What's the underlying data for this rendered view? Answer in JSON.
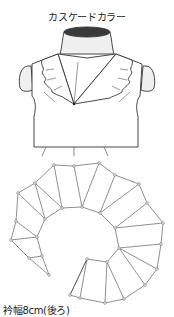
{
  "figure": {
    "title": "カスケードカラー",
    "caption": "衿幅8cm(後ろ)"
  },
  "colors": {
    "line": "#333333",
    "neck_cap": "#3a3a3a",
    "form_fill": "#f0f0f0",
    "point_fill": "#ffffff"
  },
  "pattern": {
    "outer_edge": [
      [
        11,
        240
      ],
      [
        16,
        221
      ],
      [
        18,
        193
      ],
      [
        35,
        183
      ],
      [
        54,
        165
      ],
      [
        74,
        166
      ],
      [
        99,
        163
      ],
      [
        115,
        175
      ],
      [
        139,
        184
      ],
      [
        147,
        203
      ],
      [
        163,
        223
      ],
      [
        161,
        244
      ],
      [
        157,
        269
      ],
      [
        145,
        285
      ],
      [
        124,
        299
      ],
      [
        105,
        303
      ],
      [
        80,
        298
      ],
      [
        70,
        295
      ]
    ],
    "inner_edge": [
      [
        49,
        275
      ],
      [
        42,
        256
      ],
      [
        37,
        237
      ],
      [
        45,
        219
      ],
      [
        62,
        208
      ],
      [
        82,
        207
      ],
      [
        100,
        213
      ],
      [
        115,
        228
      ],
      [
        119,
        248
      ],
      [
        107,
        262
      ],
      [
        87,
        259
      ]
    ],
    "spokes": [
      [
        [
          11,
          240
        ],
        [
          37,
          237
        ]
      ],
      [
        [
          16,
          221
        ],
        [
          37,
          237
        ]
      ],
      [
        [
          18,
          193
        ],
        [
          45,
          219
        ]
      ],
      [
        [
          35,
          183
        ],
        [
          45,
          219
        ]
      ],
      [
        [
          35,
          183
        ],
        [
          62,
          208
        ]
      ],
      [
        [
          54,
          165
        ],
        [
          62,
          208
        ]
      ],
      [
        [
          74,
          166
        ],
        [
          82,
          207
        ]
      ],
      [
        [
          99,
          163
        ],
        [
          82,
          207
        ]
      ],
      [
        [
          115,
          175
        ],
        [
          100,
          213
        ]
      ],
      [
        [
          139,
          184
        ],
        [
          100,
          213
        ]
      ],
      [
        [
          147,
          203
        ],
        [
          115,
          228
        ]
      ],
      [
        [
          163,
          223
        ],
        [
          115,
          228
        ]
      ],
      [
        [
          161,
          244
        ],
        [
          119,
          248
        ]
      ],
      [
        [
          157,
          269
        ],
        [
          119,
          248
        ]
      ],
      [
        [
          145,
          285
        ],
        [
          119,
          248
        ]
      ],
      [
        [
          124,
          299
        ],
        [
          107,
          262
        ]
      ],
      [
        [
          105,
          303
        ],
        [
          107,
          262
        ]
      ],
      [
        [
          80,
          298
        ],
        [
          87,
          259
        ]
      ],
      [
        [
          70,
          295
        ],
        [
          87,
          259
        ]
      ],
      [
        [
          11,
          240
        ],
        [
          29,
          258
        ]
      ],
      [
        [
          29,
          258
        ],
        [
          42,
          256
        ]
      ],
      [
        [
          29,
          258
        ],
        [
          49,
          275
        ]
      ]
    ]
  }
}
